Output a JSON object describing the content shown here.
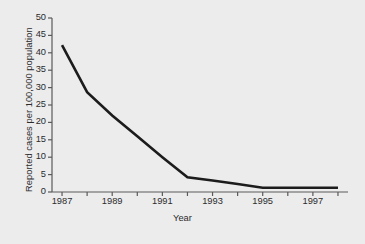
{
  "chart_data": {
    "type": "line",
    "title": "",
    "xlabel": "Year",
    "ylabel": "Reported cases per 100,000 population",
    "xlim": [
      1986.6,
      1998.4
    ],
    "ylim": [
      0,
      50
    ],
    "grid": false,
    "legend": "none",
    "line_color": "#1c1c1c",
    "background_color": "#ececed",
    "x": [
      1987,
      1988,
      1989,
      1990,
      1991,
      1992,
      1993,
      1994,
      1995,
      1996,
      1997,
      1998
    ],
    "values": [
      42.2,
      28.7,
      22.0,
      16.0,
      10.0,
      4.2,
      3.3,
      2.3,
      1.2,
      1.2,
      1.2,
      1.2
    ],
    "series": [
      {
        "name": "Reported cases per 100,000 population",
        "values": [
          42.2,
          28.7,
          22.0,
          16.0,
          10.0,
          4.2,
          3.3,
          2.3,
          1.2,
          1.2,
          1.2,
          1.2
        ]
      }
    ],
    "y_ticks": [
      0,
      5,
      10,
      15,
      20,
      25,
      30,
      35,
      40,
      45,
      50
    ],
    "y_tick_labels": [
      "0",
      "5",
      "10",
      "15",
      "20",
      "25",
      "30",
      "35",
      "40",
      "45",
      "50"
    ],
    "x_ticks": [
      1987,
      1988,
      1989,
      1990,
      1991,
      1992,
      1993,
      1994,
      1995,
      1996,
      1997,
      1998
    ],
    "x_tick_labels": [
      "1987",
      "",
      "1989",
      "",
      "1991",
      "",
      "1993",
      "",
      "1995",
      "",
      "1997",
      ""
    ],
    "x_labeled_ticks": [
      1987,
      1989,
      1991,
      1993,
      1995,
      1997
    ],
    "x_labeled_text": [
      "1987",
      "1989",
      "1991",
      "1993",
      "1995",
      "1997"
    ]
  }
}
